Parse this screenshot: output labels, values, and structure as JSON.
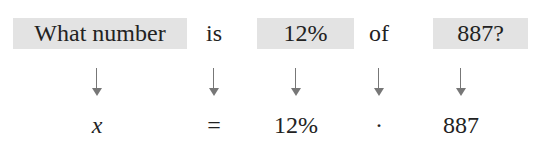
{
  "sentence": {
    "tokens": [
      {
        "text": "What number",
        "highlighted": true
      },
      {
        "text": "is",
        "highlighted": false
      },
      {
        "text": "12%",
        "highlighted": true
      },
      {
        "text": "of",
        "highlighted": false
      },
      {
        "text": "887?",
        "highlighted": true
      }
    ]
  },
  "equation": {
    "tokens": [
      {
        "text": "x"
      },
      {
        "text": "="
      },
      {
        "text": "12%"
      },
      {
        "text": "·"
      },
      {
        "text": "887"
      }
    ]
  },
  "colors": {
    "highlight": "#e3e3e3",
    "arrow": "#777777",
    "text": "#222222"
  }
}
